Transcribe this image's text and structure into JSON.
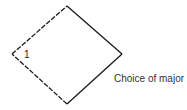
{
  "diagram": {
    "type": "decision-diamond",
    "vertex_label": "1",
    "caption": "Choice of major",
    "colors": {
      "stroke": "#1a1a1a",
      "text": "#333333",
      "background": "#ffffff"
    },
    "vertices": {
      "top": [
        67,
        6
      ],
      "right": [
        122,
        54
      ],
      "bottom": [
        67,
        104
      ],
      "left": [
        12,
        54
      ]
    },
    "edges": [
      {
        "from": "left",
        "to": "top",
        "style": "dashed"
      },
      {
        "from": "top",
        "to": "right",
        "style": "solid"
      },
      {
        "from": "right",
        "to": "bottom",
        "style": "solid"
      },
      {
        "from": "bottom",
        "to": "left",
        "style": "dashed"
      }
    ]
  }
}
